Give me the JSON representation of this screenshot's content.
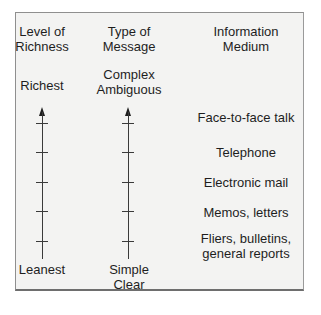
{
  "columns": [
    {
      "header_line1": "Level of",
      "header_line2": "Richness",
      "top_label": "Richest",
      "bottom_label": "Leanest"
    },
    {
      "header_line1": "Type of",
      "header_line2": "Message",
      "top_label_line1": "Complex",
      "top_label_line2": "Ambiguous",
      "bottom_label_line1": "Simple",
      "bottom_label_line2": "Clear"
    },
    {
      "header_line1": "Information",
      "header_line2": "Medium"
    }
  ],
  "media": [
    {
      "line1": "Face-to-face talk"
    },
    {
      "line1": "Telephone"
    },
    {
      "line1": "Electronic mail"
    },
    {
      "line1": "Memos, letters"
    },
    {
      "line1": "Fliers, bulletins,",
      "line2": "general reports"
    }
  ],
  "colors": {
    "background": "#f3f3f2",
    "text": "#1e1e1e",
    "line": "#3a3a3a"
  }
}
